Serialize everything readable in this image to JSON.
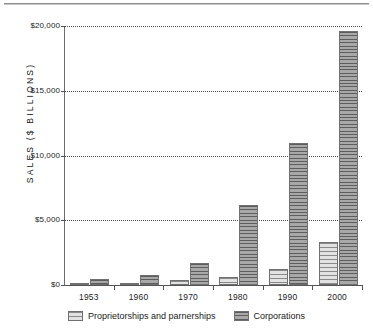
{
  "chart_data": {
    "type": "bar",
    "title": "",
    "xlabel": "",
    "ylabel": "SALES ($ BILLIONS)",
    "categories": [
      "1953",
      "1960",
      "1970",
      "1980",
      "1990",
      "2000"
    ],
    "series": [
      {
        "name": "Proprietorships and parnerships",
        "values": [
          150,
          180,
          350,
          600,
          1200,
          3300
        ]
      },
      {
        "name": "Corporations",
        "values": [
          500,
          800,
          1700,
          6200,
          11000,
          19600
        ]
      }
    ],
    "ylim": [
      0,
      20000
    ],
    "yticks": [
      0,
      5000,
      10000,
      15000,
      20000
    ],
    "ytick_labels": [
      "$0",
      "$5,000",
      "$10,000",
      "$15,000",
      "$20,000"
    ],
    "grid": true,
    "grid_axis": "y",
    "grid_style": "dotted",
    "legend_position": "bottom",
    "colors": {
      "series_0_fill": "#d5d5d5",
      "series_0_hatch": "#8a8a8a",
      "series_1_fill": "#9a9a9a",
      "series_1_hatch": "#5d5d5d",
      "axis": "#555555",
      "grid": "#4a4a4a",
      "text": "#1d1d1d"
    }
  }
}
